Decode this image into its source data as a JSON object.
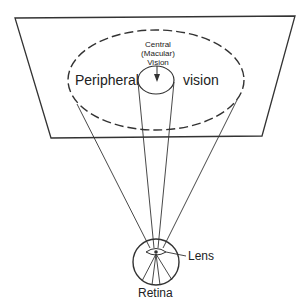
{
  "diagram": {
    "title": "",
    "labels": {
      "central": [
        "Central",
        "(Macular)",
        "Vision"
      ],
      "peripheral_left": "Peripheral",
      "peripheral_right": "vision",
      "lens": "Lens",
      "retina": "Retina"
    },
    "colors": {
      "stroke": "#333333",
      "background": "#ffffff"
    }
  }
}
